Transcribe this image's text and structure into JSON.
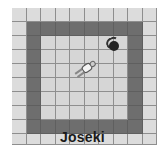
{
  "title": "Joseki",
  "board": {
    "cols": 10,
    "rows": 10,
    "wall_ring_index": [
      1,
      8
    ],
    "colors": {
      "outer": "#dcdcdc",
      "wall": "#6e6e6e",
      "floor": "#d6d6d6",
      "grid_line": "#8e8e8e"
    }
  },
  "entities": {
    "ball": {
      "icon": "ball-icon",
      "cell": [
        7,
        2
      ]
    },
    "agent": {
      "icon": "player-agent-icon",
      "cell": [
        5,
        4
      ],
      "orientation": "diagonal-up-right"
    }
  }
}
